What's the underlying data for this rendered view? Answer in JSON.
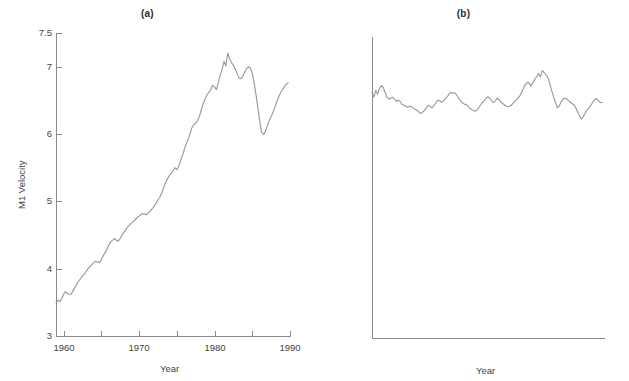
{
  "figure": {
    "background": "#ffffff",
    "line_color": "#9a9a9a",
    "axis_color": "#8a8a8a",
    "text_color": "#444444"
  },
  "panels": [
    {
      "id": "a",
      "title": "(a)",
      "xlabel": "Year",
      "ylabel": "M1 Velocity"
    },
    {
      "id": "b",
      "title": "(b)",
      "xlabel": "Year",
      "ylabel": "M2 Velocity (Ratio Scale)"
    }
  ],
  "chart_data": [
    {
      "type": "line",
      "panel": "(a)",
      "title": "(a)",
      "xlabel": "Year",
      "ylabel": "M1 Velocity",
      "xlim": [
        1959,
        1990
      ],
      "ylim": [
        3,
        7.5
      ],
      "yscale": "linear",
      "xscale": "linear",
      "grid": false,
      "legend": null,
      "xticks": [
        1960,
        1965,
        1970,
        1975,
        1980,
        1985,
        1990
      ],
      "xticklabels": [
        "1960",
        "",
        "1970",
        "",
        "1980",
        "",
        "1990"
      ],
      "yticks": [
        3,
        4,
        5,
        6,
        7,
        7.5
      ],
      "yticklabels": [
        "3",
        "4",
        "5",
        "6",
        "7",
        "7.5"
      ],
      "series": [
        {
          "name": "M1 Velocity",
          "x": [
            1959.0,
            1959.25,
            1959.5,
            1959.75,
            1960.0,
            1960.25,
            1960.5,
            1960.75,
            1961.0,
            1961.25,
            1961.5,
            1961.75,
            1962.0,
            1962.25,
            1962.5,
            1962.75,
            1963.0,
            1963.25,
            1963.5,
            1963.75,
            1964.0,
            1964.25,
            1964.5,
            1964.75,
            1965.0,
            1965.25,
            1965.5,
            1965.75,
            1966.0,
            1966.25,
            1966.5,
            1966.75,
            1967.0,
            1967.25,
            1967.5,
            1967.75,
            1968.0,
            1968.25,
            1968.5,
            1968.75,
            1969.0,
            1969.25,
            1969.5,
            1969.75,
            1970.0,
            1970.25,
            1970.5,
            1970.75,
            1971.0,
            1971.25,
            1971.5,
            1971.75,
            1972.0,
            1972.25,
            1972.5,
            1972.75,
            1973.0,
            1973.25,
            1973.5,
            1973.75,
            1974.0,
            1974.25,
            1974.5,
            1974.75,
            1975.0,
            1975.25,
            1975.5,
            1975.75,
            1976.0,
            1976.25,
            1976.5,
            1976.75,
            1977.0,
            1977.25,
            1977.5,
            1977.75,
            1978.0,
            1978.25,
            1978.5,
            1978.75,
            1979.0,
            1979.25,
            1979.5,
            1979.75,
            1980.0,
            1980.25,
            1980.5,
            1980.75,
            1981.0,
            1981.25,
            1981.5,
            1981.75,
            1982.0,
            1982.25,
            1982.5,
            1982.75,
            1983.0,
            1983.25,
            1983.5,
            1983.75,
            1984.0,
            1984.25,
            1984.5,
            1984.75,
            1985.0,
            1985.25,
            1985.5,
            1985.75,
            1986.0,
            1986.25,
            1986.5,
            1986.75,
            1987.0,
            1987.25,
            1987.5,
            1987.75,
            1988.0,
            1988.25,
            1988.5,
            1988.75,
            1989.0,
            1989.25,
            1989.5,
            1989.75
          ],
          "y": [
            3.5,
            3.53,
            3.51,
            3.55,
            3.62,
            3.66,
            3.63,
            3.62,
            3.62,
            3.67,
            3.72,
            3.77,
            3.82,
            3.85,
            3.89,
            3.92,
            3.96,
            4.0,
            4.03,
            4.06,
            4.09,
            4.11,
            4.1,
            4.09,
            4.13,
            4.19,
            4.24,
            4.29,
            4.35,
            4.4,
            4.42,
            4.45,
            4.42,
            4.41,
            4.45,
            4.5,
            4.54,
            4.58,
            4.62,
            4.65,
            4.68,
            4.7,
            4.73,
            4.76,
            4.78,
            4.8,
            4.82,
            4.81,
            4.8,
            4.83,
            4.86,
            4.89,
            4.93,
            4.97,
            5.02,
            5.06,
            5.12,
            5.2,
            5.27,
            5.33,
            5.38,
            5.41,
            5.45,
            5.5,
            5.47,
            5.52,
            5.6,
            5.68,
            5.77,
            5.85,
            5.92,
            6.0,
            6.09,
            6.14,
            6.16,
            6.2,
            6.26,
            6.36,
            6.45,
            6.52,
            6.58,
            6.62,
            6.66,
            6.72,
            6.7,
            6.66,
            6.76,
            6.87,
            6.96,
            7.08,
            7.01,
            7.2,
            7.12,
            7.06,
            7.02,
            6.96,
            6.9,
            6.83,
            6.82,
            6.86,
            6.92,
            6.97,
            7.0,
            6.98,
            6.9,
            6.76,
            6.58,
            6.38,
            6.18,
            6.02,
            5.99,
            6.04,
            6.12,
            6.2,
            6.26,
            6.32,
            6.4,
            6.48,
            6.55,
            6.61,
            6.66,
            6.7,
            6.74,
            6.76
          ]
        }
      ]
    },
    {
      "type": "line",
      "panel": "(b)",
      "title": "(b)",
      "xlabel": "Year",
      "ylabel": "M2 Velocity (Ratio Scale)",
      "xlim": [
        1959,
        1990
      ],
      "ylim": [
        0.8,
        2.0
      ],
      "yscale": "log",
      "xscale": "linear",
      "grid": false,
      "legend": null,
      "xticks": [
        1960,
        1965,
        1970,
        1975,
        1980,
        1985,
        1990
      ],
      "xticklabels": [
        "1960",
        "",
        "1970",
        "",
        "1980",
        "",
        "1990"
      ],
      "yticks": [
        0.8,
        1,
        1.2,
        1.4,
        1.6,
        1.8,
        2
      ],
      "yticklabels": [
        ".8",
        "1",
        "1.2",
        "1.4",
        "1.6",
        "1.8",
        "2"
      ],
      "series": [
        {
          "name": "M2 Velocity",
          "x": [
            1959.0,
            1959.25,
            1959.5,
            1959.75,
            1960.0,
            1960.25,
            1960.5,
            1960.75,
            1961.0,
            1961.25,
            1961.5,
            1961.75,
            1962.0,
            1962.25,
            1962.5,
            1962.75,
            1963.0,
            1963.25,
            1963.5,
            1963.75,
            1964.0,
            1964.25,
            1964.5,
            1964.75,
            1965.0,
            1965.25,
            1965.5,
            1965.75,
            1966.0,
            1966.25,
            1966.5,
            1966.75,
            1967.0,
            1967.25,
            1967.5,
            1967.75,
            1968.0,
            1968.25,
            1968.5,
            1968.75,
            1969.0,
            1969.25,
            1969.5,
            1969.75,
            1970.0,
            1970.25,
            1970.5,
            1970.75,
            1971.0,
            1971.25,
            1971.5,
            1971.75,
            1972.0,
            1972.25,
            1972.5,
            1972.75,
            1973.0,
            1973.25,
            1973.5,
            1973.75,
            1974.0,
            1974.25,
            1974.5,
            1974.75,
            1975.0,
            1975.25,
            1975.5,
            1975.75,
            1976.0,
            1976.25,
            1976.5,
            1976.75,
            1977.0,
            1977.25,
            1977.5,
            1977.75,
            1978.0,
            1978.25,
            1978.5,
            1978.75,
            1979.0,
            1979.25,
            1979.5,
            1979.75,
            1980.0,
            1980.25,
            1980.5,
            1980.75,
            1981.0,
            1981.25,
            1981.5,
            1981.75,
            1982.0,
            1982.25,
            1982.5,
            1982.75,
            1983.0,
            1983.25,
            1983.5,
            1983.75,
            1984.0,
            1984.25,
            1984.5,
            1984.75,
            1985.0,
            1985.25,
            1985.5,
            1985.75,
            1986.0,
            1986.25,
            1986.5,
            1986.75,
            1987.0,
            1987.25,
            1987.5,
            1987.75,
            1988.0,
            1988.25,
            1988.5,
            1988.75,
            1989.0,
            1989.25,
            1989.5,
            1989.75
          ],
          "y": [
            1.69,
            1.665,
            1.7,
            1.68,
            1.71,
            1.725,
            1.715,
            1.69,
            1.665,
            1.655,
            1.66,
            1.665,
            1.655,
            1.645,
            1.65,
            1.645,
            1.63,
            1.625,
            1.62,
            1.615,
            1.62,
            1.618,
            1.612,
            1.605,
            1.6,
            1.592,
            1.585,
            1.59,
            1.6,
            1.612,
            1.625,
            1.62,
            1.612,
            1.62,
            1.635,
            1.65,
            1.648,
            1.64,
            1.645,
            1.655,
            1.665,
            1.678,
            1.69,
            1.685,
            1.688,
            1.68,
            1.665,
            1.65,
            1.64,
            1.632,
            1.628,
            1.625,
            1.612,
            1.605,
            1.6,
            1.595,
            1.6,
            1.612,
            1.625,
            1.64,
            1.648,
            1.66,
            1.668,
            1.66,
            1.645,
            1.638,
            1.648,
            1.66,
            1.652,
            1.64,
            1.632,
            1.625,
            1.62,
            1.618,
            1.622,
            1.63,
            1.64,
            1.65,
            1.66,
            1.672,
            1.69,
            1.712,
            1.73,
            1.742,
            1.738,
            1.722,
            1.74,
            1.758,
            1.772,
            1.79,
            1.772,
            1.805,
            1.795,
            1.782,
            1.77,
            1.735,
            1.7,
            1.668,
            1.64,
            1.612,
            1.62,
            1.64,
            1.655,
            1.66,
            1.658,
            1.648,
            1.64,
            1.632,
            1.628,
            1.61,
            1.59,
            1.572,
            1.558,
            1.57,
            1.588,
            1.602,
            1.612,
            1.625,
            1.64,
            1.652,
            1.658,
            1.648,
            1.638,
            1.64
          ]
        }
      ]
    }
  ]
}
